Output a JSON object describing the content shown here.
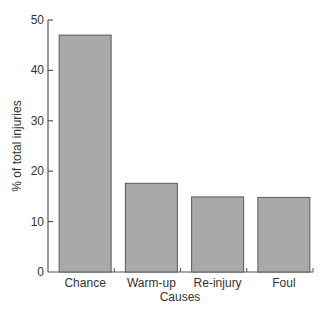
{
  "chart_data": {
    "type": "bar",
    "title": "",
    "xlabel": "Causes",
    "ylabel": "% of total injuries",
    "categories": [
      "Chance",
      "Warm-up",
      "Re-injury",
      "Foul"
    ],
    "values": [
      47,
      17.6,
      14.9,
      14.8
    ],
    "ylim": [
      0,
      50
    ],
    "yticks": [
      0,
      10,
      20,
      30,
      40,
      50
    ],
    "grid": false,
    "legend": null,
    "colors": {
      "bar_fill": "#a9a9a9",
      "bar_stroke": "#5a5a5a",
      "axis": "#555555"
    }
  }
}
